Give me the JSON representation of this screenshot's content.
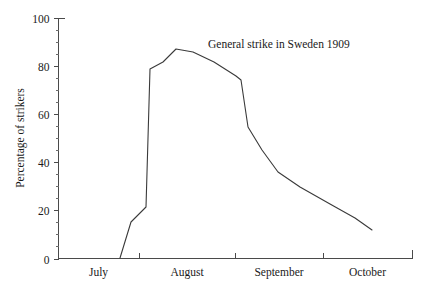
{
  "chart_data": {
    "type": "line",
    "title": "",
    "annotations": [
      {
        "text": "General strike in Sweden 1909",
        "x_px": 208,
        "y_px": 48
      }
    ],
    "xlabel": "",
    "ylabel": "Percentage of strikers",
    "ylim": [
      0,
      100
    ],
    "y_ticks_major": [
      0,
      20,
      40,
      60,
      80,
      100
    ],
    "y_tick_labels": [
      "0",
      "20",
      "40",
      "60",
      "80",
      "100"
    ],
    "y_ticks_minor": [
      5,
      10,
      15,
      25,
      30,
      35,
      45,
      50,
      55,
      65,
      70,
      75,
      85,
      90,
      95
    ],
    "x_tick_labels": [
      "July",
      "August",
      "September",
      "October"
    ],
    "x_boundary_px": [
      58,
      139,
      235,
      323,
      412
    ],
    "grid": false,
    "legend": false,
    "line_color": "#3a3a3a",
    "background_color": "#ffffff",
    "series": [
      {
        "name": "Percentage of strikers",
        "points_px": [
          [
            120,
            258
          ],
          [
            131,
            222
          ],
          [
            146,
            207
          ],
          [
            150,
            69
          ],
          [
            163,
            62
          ],
          [
            176,
            49
          ],
          [
            193,
            52
          ],
          [
            214,
            62
          ],
          [
            236,
            76
          ],
          [
            241,
            80
          ],
          [
            248,
            127
          ],
          [
            262,
            150
          ],
          [
            278,
            172
          ],
          [
            300,
            187
          ],
          [
            330,
            204
          ],
          [
            355,
            218
          ],
          [
            372,
            230
          ]
        ],
        "values_approx": [
          0,
          15,
          21,
          79,
          82,
          87,
          86,
          82,
          76,
          74,
          55,
          45,
          36,
          30,
          22,
          17,
          12
        ]
      }
    ]
  },
  "axes": {
    "y_axis_title": "Percentage of strikers"
  }
}
